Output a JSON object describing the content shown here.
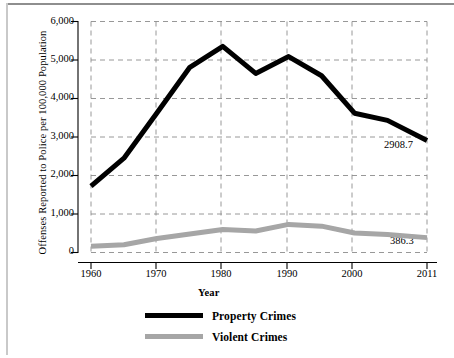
{
  "chart_data": {
    "type": "line",
    "title": "",
    "subtitle": "",
    "xlabel": "Year",
    "ylabel": "Offenses Reported to Police per 100,000 Population",
    "xlim": [
      1960,
      2011
    ],
    "ylim": [
      0,
      6000
    ],
    "grid": true,
    "grid_style": "dashed",
    "legend_position": "bottom-center",
    "xticks": [
      1960,
      1970,
      1980,
      1990,
      2000,
      2011
    ],
    "xtick_labels": [
      "1960",
      "1970",
      "1980",
      "1990",
      "2000",
      "2011"
    ],
    "yticks": [
      0,
      1000,
      2000,
      3000,
      4000,
      5000,
      6000
    ],
    "ytick_labels": [
      "0",
      "1,000",
      "2,000",
      "3,000",
      "4,000",
      "5,000",
      "6,000"
    ],
    "x": [
      1960,
      1965,
      1970,
      1975,
      1980,
      1985,
      1990,
      1995,
      2000,
      2005,
      2011
    ],
    "series": [
      {
        "name": "Property Crimes",
        "color": "#000000",
        "values": [
          1726,
          2449,
          3621,
          4811,
          5353,
          4651,
          5089,
          4591,
          3618,
          3432,
          2908.7
        ]
      },
      {
        "name": "Violent Crimes",
        "color": "#a6a6a6",
        "values": [
          161,
          200,
          364,
          482,
          597,
          557,
          730,
          685,
          506,
          469,
          386.3
        ]
      }
    ],
    "annotations": [
      {
        "text": "2908.7",
        "series": "Property Crimes",
        "x": 2011,
        "y": 2908.7
      },
      {
        "text": "386.3",
        "series": "Violent Crimes",
        "x": 2011,
        "y": 386.3
      }
    ]
  },
  "legend": {
    "items": [
      {
        "label": "Property Crimes",
        "color": "#000000"
      },
      {
        "label": "Violent Crimes",
        "color": "#a6a6a6"
      }
    ]
  }
}
